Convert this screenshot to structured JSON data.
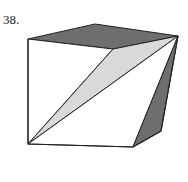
{
  "problem": {
    "number": "38."
  },
  "figure": {
    "colors": {
      "dark_face": "#6e6e6e",
      "light_face": "#d9d9d9",
      "edge": "#222222",
      "white": "#ffffff"
    }
  }
}
